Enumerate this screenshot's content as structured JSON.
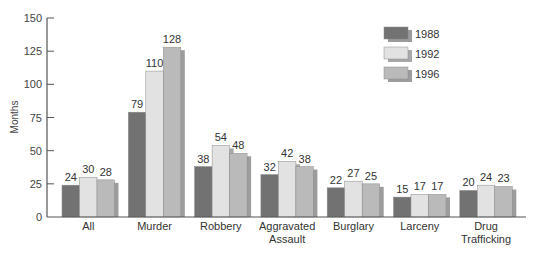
{
  "chart_data": {
    "type": "bar",
    "title": "",
    "xlabel": "",
    "ylabel": "Months",
    "ylim": [
      0,
      150
    ],
    "yticks": [
      0,
      25,
      50,
      75,
      100,
      125,
      150
    ],
    "grid": false,
    "legend_position": "top-right",
    "categories": [
      "All",
      "Murder",
      "Robbery",
      "Aggravated Assault",
      "Burglary",
      "Larceny",
      "Drug Trafficking"
    ],
    "category_lines": [
      [
        "All"
      ],
      [
        "Murder"
      ],
      [
        "Robbery"
      ],
      [
        "Aggravated",
        "Assault"
      ],
      [
        "Burglary"
      ],
      [
        "Larceny"
      ],
      [
        "Drug",
        "Trafficking"
      ]
    ],
    "series": [
      {
        "name": "1988",
        "color": "#727272",
        "shadow": "#9a9a9a",
        "values": [
          24,
          79,
          38,
          32,
          22,
          15,
          20
        ]
      },
      {
        "name": "1992",
        "color": "#e2e2e2",
        "shadow": "#a8a8a8",
        "values": [
          30,
          110,
          54,
          42,
          27,
          17,
          24
        ]
      },
      {
        "name": "1996",
        "color": "#bababa",
        "shadow": "#9c9c9c",
        "values": [
          28,
          128,
          48,
          38,
          25,
          17,
          23
        ]
      }
    ]
  }
}
